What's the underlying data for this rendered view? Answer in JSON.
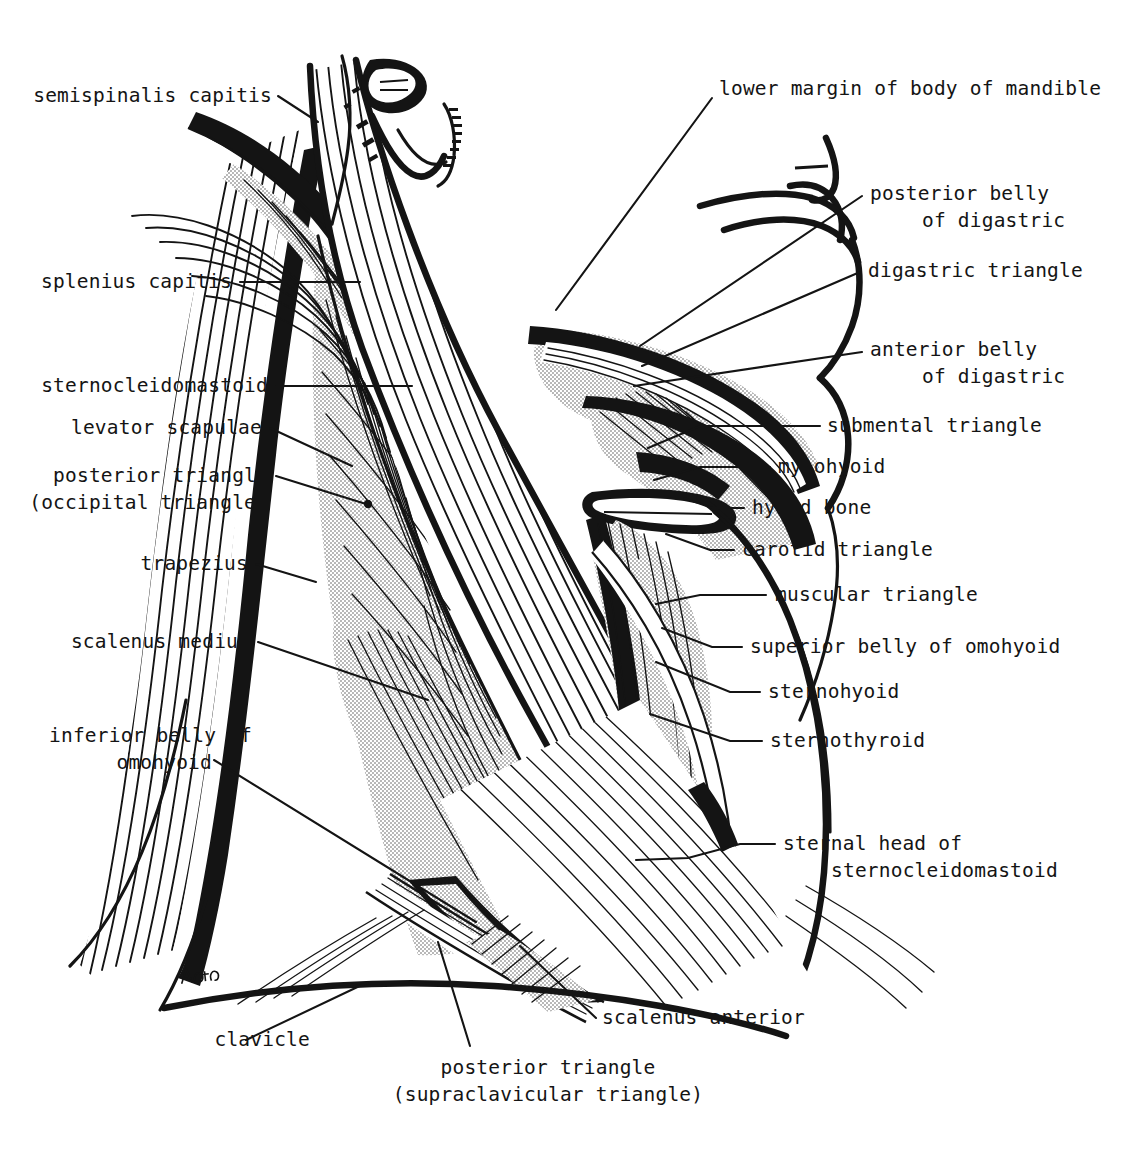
{
  "figure": {
    "ink_color": "#141414",
    "background_color": "#ffffff",
    "stipple_color": "#b8b8b8",
    "artist_signature": "initials"
  },
  "labels": {
    "left": [
      {
        "id": "semispinalis-capitis",
        "text": "semispinalis capitis",
        "x": 272,
        "y": 102,
        "lines": [
          "semispinalis capitis"
        ]
      },
      {
        "id": "splenius-capitis",
        "text": "splenius capitis",
        "x": 232,
        "y": 288,
        "lines": [
          "splenius capitis"
        ]
      },
      {
        "id": "sternocleidomastoid",
        "text": "sternocleidomastoid",
        "x": 268,
        "y": 392,
        "lines": [
          "sternocleidomastoid"
        ]
      },
      {
        "id": "levator-scapulae",
        "text": "levator scapulae",
        "x": 262,
        "y": 434,
        "lines": [
          "levator scapulae"
        ]
      },
      {
        "id": "posterior-triangle-occipital",
        "text": "posterior triangle (occipital triangle)",
        "x": 268,
        "y": 482,
        "lines": [
          "posterior triangle",
          "(occipital triangle)"
        ]
      },
      {
        "id": "trapezius",
        "text": "trapezius",
        "x": 248,
        "y": 570,
        "lines": [
          "trapezius"
        ]
      },
      {
        "id": "scalenus-medius",
        "text": "scalenus medius",
        "x": 250,
        "y": 648,
        "lines": [
          "scalenus medius"
        ]
      },
      {
        "id": "inferior-belly-of-omohyoid",
        "text": "inferior belly of omohyoid",
        "x": 252,
        "y": 742,
        "lines": [
          "inferior belly of",
          "omohyoid"
        ]
      }
    ],
    "right": [
      {
        "id": "lower-margin-of-body-of-mandible",
        "text": "lower margin of body of mandible",
        "x": 719,
        "y": 95,
        "lines": [
          "lower margin of body of mandible"
        ]
      },
      {
        "id": "posterior-belly-of-digastric",
        "text": "posterior belly of digastric",
        "x": 870,
        "y": 200,
        "lines": [
          "posterior belly",
          "of digastric"
        ]
      },
      {
        "id": "digastric-triangle",
        "text": "digastric triangle",
        "x": 868,
        "y": 277,
        "lines": [
          "digastric triangle"
        ]
      },
      {
        "id": "anterior-belly-of-digastric",
        "text": "anterior belly of digastric",
        "x": 870,
        "y": 356,
        "lines": [
          "anterior belly",
          "of digastric"
        ]
      },
      {
        "id": "submental-triangle",
        "text": "submental triangle",
        "x": 827,
        "y": 432,
        "lines": [
          "submental triangle"
        ]
      },
      {
        "id": "mylohyoid",
        "text": "mylohyoid",
        "x": 778,
        "y": 473,
        "lines": [
          "mylohyoid"
        ]
      },
      {
        "id": "hyoid-bone",
        "text": "hyoid bone",
        "x": 752,
        "y": 514,
        "lines": [
          "hyoid bone"
        ]
      },
      {
        "id": "carotid-triangle",
        "text": "carotid triangle",
        "x": 742,
        "y": 556,
        "lines": [
          "carotid triangle"
        ]
      },
      {
        "id": "muscular-triangle",
        "text": "muscular triangle",
        "x": 775,
        "y": 601,
        "lines": [
          "muscular triangle"
        ]
      },
      {
        "id": "superior-belly-of-omohyoid",
        "text": "superior belly of omohyoid",
        "x": 750,
        "y": 653,
        "lines": [
          "superior belly of omohyoid"
        ]
      },
      {
        "id": "sternohyoid",
        "text": "sternohyoid",
        "x": 768,
        "y": 698,
        "lines": [
          "sternohyoid"
        ]
      },
      {
        "id": "sternothyroid",
        "text": "sternothyroid",
        "x": 770,
        "y": 747,
        "lines": [
          "sternothyroid"
        ]
      },
      {
        "id": "sternal-head-of-sternocleidomastoid",
        "text": "sternal head of sternocleidomastoid",
        "x": 783,
        "y": 850,
        "lines": [
          "sternal head of",
          "sternocleidomastoid"
        ]
      }
    ],
    "bottom": [
      {
        "id": "clavicle",
        "text": "clavicle",
        "x": 222,
        "y": 1046,
        "lines": [
          "clavicle"
        ]
      },
      {
        "id": "scalenus-anterior",
        "text": "scalenus anterior",
        "x": 602,
        "y": 1024,
        "lines": [
          "scalenus anterior"
        ]
      },
      {
        "id": "posterior-triangle-supraclavicular",
        "text": "posterior triangle (supraclavicular triangle)",
        "x": 548,
        "y": 1074,
        "lines": [
          "posterior triangle",
          "(supraclavicular triangle)"
        ]
      }
    ]
  },
  "structures": [
    "semispinalis capitis",
    "splenius capitis",
    "sternocleidomastoid",
    "levator scapulae",
    "trapezius",
    "scalenus medius",
    "scalenus anterior",
    "inferior belly of omohyoid",
    "superior belly of omohyoid",
    "sternohyoid",
    "sternothyroid",
    "mylohyoid",
    "hyoid bone",
    "anterior belly of digastric",
    "posterior belly of digastric",
    "clavicle",
    "lower margin of body of mandible"
  ],
  "triangles": [
    "posterior triangle (occipital triangle)",
    "posterior triangle (supraclavicular triangle)",
    "digastric triangle",
    "submental triangle",
    "carotid triangle",
    "muscular triangle"
  ]
}
